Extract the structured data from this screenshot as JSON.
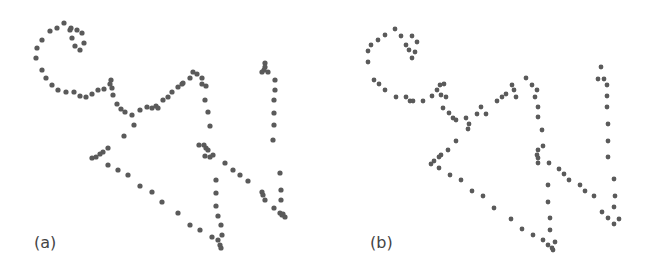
{
  "figure": {
    "dot_color": "#5a5a5a",
    "background": "#ffffff",
    "panels": [
      {
        "id": "a",
        "label": "(a)",
        "style": "blurred",
        "dot_radius": 2.6,
        "points": [
          [
            64,
            23
          ],
          [
            57,
            28
          ],
          [
            50,
            31
          ],
          [
            42,
            40
          ],
          [
            37,
            48
          ],
          [
            36,
            58
          ],
          [
            70,
            30
          ],
          [
            72,
            38
          ],
          [
            75,
            46
          ],
          [
            80,
            50
          ],
          [
            84,
            43
          ],
          [
            82,
            33
          ],
          [
            77,
            30
          ],
          [
            71,
            28
          ],
          [
            42,
            70
          ],
          [
            46,
            78
          ],
          [
            52,
            85
          ],
          [
            58,
            90
          ],
          [
            66,
            92
          ],
          [
            74,
            92
          ],
          [
            80,
            96
          ],
          [
            86,
            97
          ],
          [
            92,
            94
          ],
          [
            98,
            90
          ],
          [
            104,
            89
          ],
          [
            110,
            84
          ],
          [
            111,
            80
          ],
          [
            112,
            88
          ],
          [
            113,
            95
          ],
          [
            117,
            104
          ],
          [
            121,
            109
          ],
          [
            125,
            112
          ],
          [
            132,
            115
          ],
          [
            140,
            110
          ],
          [
            147,
            107
          ],
          [
            152,
            108
          ],
          [
            156,
            106
          ],
          [
            158,
            108
          ],
          [
            163,
            100
          ],
          [
            168,
            97
          ],
          [
            172,
            92
          ],
          [
            178,
            87
          ],
          [
            182,
            84
          ],
          [
            183,
            83
          ],
          [
            190,
            78
          ],
          [
            134,
            125
          ],
          [
            124,
            136
          ],
          [
            108,
            148
          ],
          [
            103,
            152
          ],
          [
            100,
            154
          ],
          [
            92,
            158
          ],
          [
            96,
            157
          ],
          [
            108,
            165
          ],
          [
            118,
            170
          ],
          [
            128,
            175
          ],
          [
            140,
            186
          ],
          [
            152,
            192
          ],
          [
            162,
            202
          ],
          [
            178,
            213
          ],
          [
            190,
            225
          ],
          [
            200,
            230
          ],
          [
            212,
            237
          ],
          [
            218,
            240
          ],
          [
            220,
            245
          ],
          [
            221,
            248
          ],
          [
            193,
            72
          ],
          [
            197,
            74
          ],
          [
            202,
            78
          ],
          [
            202,
            84
          ],
          [
            206,
            86
          ],
          [
            205,
            100
          ],
          [
            208,
            112
          ],
          [
            210,
            126
          ],
          [
            199,
            145
          ],
          [
            204,
            145
          ],
          [
            206,
            148
          ],
          [
            208,
            150
          ],
          [
            205,
            156
          ],
          [
            210,
            157
          ],
          [
            213,
            155
          ],
          [
            225,
            163
          ],
          [
            233,
            170
          ],
          [
            240,
            175
          ],
          [
            248,
            181
          ],
          [
            262,
            192
          ],
          [
            263,
            195
          ],
          [
            265,
            200
          ],
          [
            274,
            208
          ],
          [
            280,
            213
          ],
          [
            282,
            215
          ],
          [
            285,
            217
          ],
          [
            283,
            214
          ],
          [
            216,
            180
          ],
          [
            216,
            193
          ],
          [
            216,
            206
          ],
          [
            218,
            216
          ],
          [
            221,
            225
          ],
          [
            222,
            235
          ],
          [
            265,
            63
          ],
          [
            265,
            67
          ],
          [
            264,
            70
          ],
          [
            262,
            72
          ],
          [
            268,
            72
          ],
          [
            275,
            80
          ],
          [
            275,
            90
          ],
          [
            274,
            100
          ],
          [
            274,
            113
          ],
          [
            274,
            125
          ],
          [
            273,
            140
          ],
          [
            280,
            173
          ],
          [
            281,
            190
          ],
          [
            281,
            200
          ]
        ]
      },
      {
        "id": "b",
        "label": "(b)",
        "style": "crisp",
        "dot_radius": 2.4,
        "points": [
          [
            71,
            29
          ],
          [
            61,
            35
          ],
          [
            54,
            40
          ],
          [
            47,
            45
          ],
          [
            44,
            51
          ],
          [
            44,
            62
          ],
          [
            77,
            36
          ],
          [
            82,
            45
          ],
          [
            88,
            36
          ],
          [
            93,
            42
          ],
          [
            85,
            50
          ],
          [
            91,
            52
          ],
          [
            88,
            58
          ],
          [
            50,
            80
          ],
          [
            55,
            84
          ],
          [
            61,
            90
          ],
          [
            72,
            97
          ],
          [
            82,
            97
          ],
          [
            86,
            101
          ],
          [
            89,
            101
          ],
          [
            99,
            101
          ],
          [
            108,
            96
          ],
          [
            113,
            90
          ],
          [
            117,
            95
          ],
          [
            116,
            85
          ],
          [
            120,
            84
          ],
          [
            122,
            97
          ],
          [
            119,
            108
          ],
          [
            125,
            113
          ],
          [
            129,
            118
          ],
          [
            132,
            120
          ],
          [
            142,
            118
          ],
          [
            145,
            124
          ],
          [
            153,
            114
          ],
          [
            157,
            107
          ],
          [
            162,
            114
          ],
          [
            173,
            101
          ],
          [
            178,
            97
          ],
          [
            182,
            94
          ],
          [
            188,
            85
          ],
          [
            190,
            90
          ],
          [
            192,
            97
          ],
          [
            144,
            129
          ],
          [
            132,
            141
          ],
          [
            124,
            150
          ],
          [
            117,
            155
          ],
          [
            115,
            157
          ],
          [
            110,
            161
          ],
          [
            107,
            164
          ],
          [
            115,
            168
          ],
          [
            126,
            175
          ],
          [
            137,
            180
          ],
          [
            148,
            191
          ],
          [
            159,
            196
          ],
          [
            170,
            208
          ],
          [
            187,
            219
          ],
          [
            198,
            229
          ],
          [
            209,
            235
          ],
          [
            219,
            240
          ],
          [
            224,
            245
          ],
          [
            229,
            250
          ],
          [
            202,
            78
          ],
          [
            208,
            85
          ],
          [
            213,
            90
          ],
          [
            211,
            97
          ],
          [
            214,
            107
          ],
          [
            214,
            117
          ],
          [
            218,
            130
          ],
          [
            219,
            146
          ],
          [
            214,
            150
          ],
          [
            213,
            155
          ],
          [
            214,
            158
          ],
          [
            214,
            163
          ],
          [
            225,
            163
          ],
          [
            235,
            169
          ],
          [
            240,
            174
          ],
          [
            245,
            180
          ],
          [
            256,
            185
          ],
          [
            261,
            191
          ],
          [
            270,
            196
          ],
          [
            224,
            185
          ],
          [
            224,
            202
          ],
          [
            226,
            218
          ],
          [
            226,
            230
          ],
          [
            231,
            242
          ],
          [
            228,
            248
          ],
          [
            277,
            67
          ],
          [
            274,
            79
          ],
          [
            280,
            79
          ],
          [
            283,
            85
          ],
          [
            283,
            96
          ],
          [
            283,
            107
          ],
          [
            284,
            124
          ],
          [
            284,
            141
          ],
          [
            284,
            157
          ],
          [
            290,
            179
          ],
          [
            291,
            196
          ],
          [
            290,
            207
          ],
          [
            278,
            212
          ],
          [
            284,
            218
          ],
          [
            290,
            224
          ],
          [
            295,
            219
          ]
        ]
      }
    ]
  }
}
